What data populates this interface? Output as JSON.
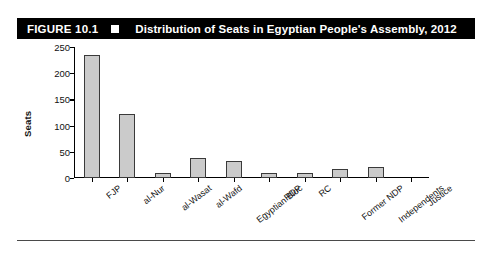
{
  "figure": {
    "number_label": "FIGURE 10.1",
    "bullet_icon": "square-bullet-icon",
    "title": "Distribution of Seats in Egyptian People's Assembly, 2012"
  },
  "colors": {
    "banner_background": "#000000",
    "banner_text": "#ffffff",
    "bar_fill": "#cbcbcb",
    "bar_stroke": "#3a3a3a",
    "axis": "#000000",
    "footer_rule": "#4a4a4a"
  },
  "chart_data": {
    "type": "bar",
    "title": "Distribution of Seats in Egyptian People's Assembly, 2012",
    "xlabel": "",
    "ylabel": "Seats",
    "ylim": [
      0,
      250
    ],
    "yticks": [
      0,
      50,
      100,
      150,
      200,
      250
    ],
    "grid": false,
    "legend": null,
    "categories": [
      "FJP",
      "al-Nur",
      "al-Wasat",
      "al-Wafd",
      "Egyptian Bloc",
      "RDP",
      "RC",
      "Former NDP",
      "Independents",
      "Justice"
    ],
    "values": [
      235,
      123,
      10,
      38,
      33,
      9,
      9,
      17,
      21,
      1
    ]
  }
}
